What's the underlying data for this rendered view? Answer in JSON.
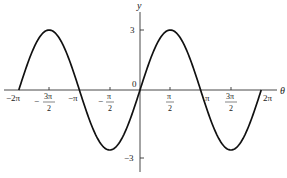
{
  "chart_data": {
    "type": "line",
    "title": "",
    "xlabel": "θ",
    "ylabel": "y",
    "function": "y = 3 sin θ",
    "xlim": [
      -6.2832,
      6.2832
    ],
    "ylim": [
      -3,
      3
    ],
    "grid": false,
    "legend": null,
    "x_ticks": [
      {
        "value": -6.2832,
        "label": "−2π"
      },
      {
        "value": -4.7124,
        "label": "−3π/2",
        "num": "3π",
        "den": "2",
        "neg": true
      },
      {
        "value": -3.1416,
        "label": "−π"
      },
      {
        "value": -1.5708,
        "label": "−π/2",
        "num": "π",
        "den": "2",
        "neg": true
      },
      {
        "value": 1.5708,
        "label": "π/2",
        "num": "π",
        "den": "2",
        "neg": false
      },
      {
        "value": 3.1416,
        "label": "π"
      },
      {
        "value": 4.7124,
        "label": "3π/2",
        "num": "3π",
        "den": "2",
        "neg": false
      },
      {
        "value": 6.2832,
        "label": "2π"
      }
    ],
    "y_ticks": [
      {
        "value": 3,
        "label": "3"
      },
      {
        "value": -3,
        "label": "−3"
      }
    ],
    "origin_label": "0",
    "series": [
      {
        "name": "3 sin θ",
        "x": [
          -6.2832,
          -4.7124,
          -3.1416,
          -1.5708,
          0,
          1.5708,
          3.1416,
          4.7124,
          6.2832
        ],
        "values": [
          0,
          3,
          0,
          -3,
          0,
          3,
          0,
          -3,
          0
        ]
      }
    ]
  },
  "labels": {
    "y_axis": "y",
    "x_axis": "θ",
    "origin": "0",
    "y_max": "3",
    "y_min": "−3",
    "neg_two_pi": "−2π",
    "neg_three_pi_half_num": "3π",
    "neg_three_pi_half_den": "2",
    "neg_pi": "−π",
    "neg_pi_half_num": "π",
    "neg_pi_half_den": "2",
    "pi_half_num": "π",
    "pi_half_den": "2",
    "pi": "π",
    "three_pi_half_num": "3π",
    "three_pi_half_den": "2",
    "two_pi": "2π"
  }
}
